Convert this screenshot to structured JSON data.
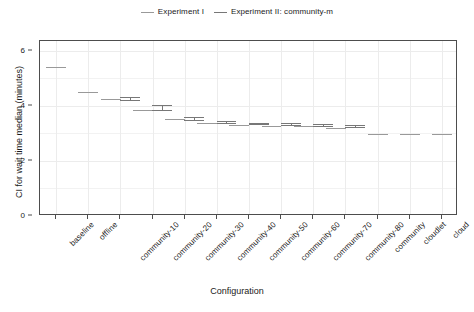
{
  "chart_data": {
    "type": "line",
    "title": "",
    "xlabel": "Configuration",
    "ylabel": "CI for wait time median (minutes)",
    "ylim": [
      0,
      6.35
    ],
    "yticks": [
      0,
      2,
      4,
      6
    ],
    "ytick_labels": [
      "0",
      "2",
      "4",
      "6"
    ],
    "grid": true,
    "legend_position": "top-center",
    "categories": [
      "baseline",
      "offline",
      "community-10",
      "community-20",
      "community-30",
      "community-40",
      "community-50",
      "community-60",
      "community-70",
      "community-80",
      "community",
      "cloudlet",
      "cloud"
    ],
    "series": [
      {
        "name": "Experiment I",
        "color": "#999999",
        "values": [
          5.43,
          4.51,
          4.26,
          3.88,
          3.53,
          3.4,
          3.33,
          3.3,
          3.28,
          3.22,
          3.01,
          3.01,
          3.0
        ],
        "ci_low": [
          5.43,
          4.51,
          4.26,
          3.88,
          3.53,
          3.4,
          3.33,
          3.3,
          3.28,
          3.22,
          3.01,
          3.01,
          3.0
        ],
        "ci_high": [
          5.43,
          4.51,
          4.26,
          3.88,
          3.53,
          3.4,
          3.33,
          3.3,
          3.28,
          3.22,
          3.01,
          3.01,
          3.0
        ]
      },
      {
        "name": "Experiment II: community-m",
        "color": "#777777",
        "values": [
          null,
          null,
          4.25,
          3.92,
          3.52,
          3.4,
          3.34,
          3.31,
          3.29,
          3.24,
          null,
          null,
          null
        ],
        "ci_low": [
          null,
          null,
          4.19,
          3.81,
          3.45,
          3.34,
          3.29,
          3.26,
          3.24,
          3.19,
          null,
          null,
          null
        ],
        "ci_high": [
          null,
          null,
          4.31,
          4.02,
          3.58,
          3.46,
          3.39,
          3.36,
          3.34,
          3.29,
          null,
          null,
          null
        ]
      }
    ]
  },
  "legend": {
    "entries": [
      {
        "label": "Experiment I",
        "swatch": "line-swatch-exp1"
      },
      {
        "label": "Experiment II: community-m",
        "swatch": "line-swatch-exp2"
      }
    ]
  },
  "axes": {
    "y_title": "CI for wait time median (minutes)",
    "x_title": "Configuration",
    "y_tick_labels": [
      "0",
      "2",
      "4",
      "6"
    ],
    "x_tick_labels": [
      "baseline",
      "offline",
      "community-10",
      "community-20",
      "community-30",
      "community-40",
      "community-50",
      "community-60",
      "community-70",
      "community-80",
      "community",
      "cloudlet",
      "cloud"
    ]
  },
  "colors": {
    "exp1": "#999999",
    "exp2": "#777777",
    "axis": "#4d4d4d",
    "grid": "#f2f2f2",
    "background": "#ffffff",
    "text": "#1a1a1a"
  }
}
